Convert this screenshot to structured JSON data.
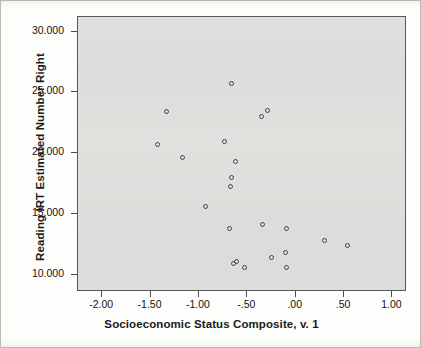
{
  "figure": {
    "background_color": "#fdfdfc",
    "plot_area_color": "#dcdcda",
    "frame_color": "#57575a",
    "marker_color": "#44444a"
  },
  "chart_data": {
    "type": "scatter",
    "title": "",
    "xlabel": "Socioeconomic Status Composite, v. 1",
    "ylabel": "Reading IRT Estimated Number Right",
    "xlim": [
      -2.25,
      1.15
    ],
    "ylim": [
      8.6,
      31.2
    ],
    "xticks": [
      -2.0,
      -1.5,
      -1.0,
      -0.5,
      0.0,
      0.5,
      1.0
    ],
    "xticklabels": [
      "-2.00",
      "-1.50",
      "-1.00",
      "-.50",
      ".00",
      ".50",
      "1.00"
    ],
    "yticks": [
      10.0,
      15.0,
      20.0,
      25.0,
      30.0
    ],
    "yticklabels": [
      "10.000",
      "15.000",
      "20.000",
      "25.000",
      "30.000"
    ],
    "grid": false,
    "legend": false,
    "marker": "open-circle",
    "points": [
      {
        "x": -1.33,
        "y": 23.4
      },
      {
        "x": -1.42,
        "y": 20.7
      },
      {
        "x": -1.16,
        "y": 19.6
      },
      {
        "x": -0.66,
        "y": 25.7
      },
      {
        "x": -0.73,
        "y": 20.9
      },
      {
        "x": -0.35,
        "y": 23.0
      },
      {
        "x": -0.29,
        "y": 23.5
      },
      {
        "x": -0.62,
        "y": 19.3
      },
      {
        "x": -0.66,
        "y": 18.0
      },
      {
        "x": -0.67,
        "y": 17.2
      },
      {
        "x": -0.93,
        "y": 15.6
      },
      {
        "x": -0.68,
        "y": 13.8
      },
      {
        "x": -0.34,
        "y": 14.1
      },
      {
        "x": -0.09,
        "y": 13.8
      },
      {
        "x": 0.3,
        "y": 12.8
      },
      {
        "x": 0.54,
        "y": 12.4
      },
      {
        "x": -0.1,
        "y": 11.8
      },
      {
        "x": -0.24,
        "y": 11.4
      },
      {
        "x": -0.64,
        "y": 10.9
      },
      {
        "x": -0.61,
        "y": 11.1
      },
      {
        "x": -0.52,
        "y": 10.6
      },
      {
        "x": -0.09,
        "y": 10.6
      }
    ]
  }
}
